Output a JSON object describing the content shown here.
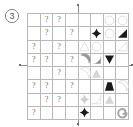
{
  "panel": {
    "label": "3",
    "label_icon": "circled-number-icon"
  },
  "grid": {
    "rows": 8,
    "cols": 8,
    "line_color": "#b9b9b9",
    "unknown_glyph": "?",
    "cells": [
      [
        {
          "type": "empty"
        },
        {
          "type": "unknown",
          "glyph": "?"
        },
        {
          "type": "unknown",
          "glyph": "?"
        },
        {
          "type": "empty"
        },
        {
          "type": "empty"
        },
        {
          "type": "empty"
        },
        {
          "type": "shape",
          "shape": "circle-outline",
          "tone": "faint",
          "color": "#d8d8d8"
        },
        {
          "type": "shape",
          "shape": "circle-outline",
          "tone": "faint",
          "color": "#d8d8d8"
        }
      ],
      [
        {
          "type": "empty"
        },
        {
          "type": "unknown",
          "glyph": "?"
        },
        {
          "type": "empty"
        },
        {
          "type": "unknown",
          "glyph": "?"
        },
        {
          "type": "empty"
        },
        {
          "type": "shape",
          "shape": "four-point-star",
          "tone": "dark",
          "color": "#1b1b1b"
        },
        {
          "type": "shape",
          "shape": "circle-outline",
          "tone": "faint",
          "color": "#d8d8d8"
        },
        {
          "type": "shape",
          "shape": "right-triangle",
          "tone": "dark",
          "color": "#1b1b1b"
        }
      ],
      [
        {
          "type": "unknown",
          "glyph": "?"
        },
        {
          "type": "empty"
        },
        {
          "type": "unknown",
          "glyph": "?"
        },
        {
          "type": "empty"
        },
        {
          "type": "shape",
          "shape": "triangle-outline",
          "tone": "faint",
          "color": "#dcdcdc"
        },
        {
          "type": "shape",
          "shape": "circle-outline",
          "tone": "faint",
          "color": "#dcdcdc"
        },
        {
          "type": "empty"
        },
        {
          "type": "shape",
          "shape": "right-triangle-outline",
          "tone": "faint",
          "color": "#dcdcdc"
        }
      ],
      [
        {
          "type": "unknown",
          "glyph": "?"
        },
        {
          "type": "unknown",
          "glyph": "?"
        },
        {
          "type": "empty"
        },
        {
          "type": "unknown",
          "glyph": "?"
        },
        {
          "type": "shape",
          "shape": "quarter-moon",
          "tone": "mid",
          "color": "#9a9a9a"
        },
        {
          "type": "shape",
          "shape": "quarter-pie",
          "tone": "mid",
          "color": "#8e8e8e"
        },
        {
          "type": "shape",
          "shape": "triangle-down",
          "tone": "dark",
          "color": "#1b1b1b"
        },
        {
          "type": "empty"
        }
      ],
      [
        {
          "type": "empty"
        },
        {
          "type": "empty"
        },
        {
          "type": "unknown",
          "glyph": "?"
        },
        {
          "type": "empty"
        },
        {
          "type": "shape",
          "shape": "quarter-moon-outline",
          "tone": "faint",
          "color": "#e0e0e0"
        },
        {
          "type": "shape",
          "shape": "triangle-up",
          "tone": "faint",
          "color": "#d5d5d5"
        },
        {
          "type": "empty"
        },
        {
          "type": "empty"
        }
      ],
      [
        {
          "type": "unknown",
          "glyph": "?"
        },
        {
          "type": "unknown",
          "glyph": "?"
        },
        {
          "type": "empty"
        },
        {
          "type": "unknown",
          "glyph": "?"
        },
        {
          "type": "empty"
        },
        {
          "type": "empty"
        },
        {
          "type": "shape",
          "shape": "trapezoid",
          "tone": "dark",
          "color": "#1b1b1b"
        },
        {
          "type": "shape",
          "shape": "quarter-moon-outline",
          "tone": "faint",
          "color": "#d8d8d8"
        }
      ],
      [
        {
          "type": "empty"
        },
        {
          "type": "unknown",
          "glyph": "?"
        },
        {
          "type": "unknown",
          "glyph": "?"
        },
        {
          "type": "empty"
        },
        {
          "type": "shape",
          "shape": "four-point-star",
          "tone": "faint",
          "color": "#cfcfcf"
        },
        {
          "type": "shape",
          "shape": "quarter-pie-outline",
          "tone": "faint",
          "color": "#e0e0e0"
        },
        {
          "type": "shape",
          "shape": "triangle-up",
          "tone": "faint",
          "color": "#d5d5d5"
        },
        {
          "type": "empty"
        }
      ],
      [
        {
          "type": "unknown",
          "glyph": "?"
        },
        {
          "type": "empty"
        },
        {
          "type": "empty"
        },
        {
          "type": "empty"
        },
        {
          "type": "shape",
          "shape": "four-point-star",
          "tone": "dark",
          "color": "#1b1b1b"
        },
        {
          "type": "empty"
        },
        {
          "type": "empty"
        },
        {
          "type": "shape",
          "shape": "spiral",
          "tone": "mid",
          "color": "#a6a6a6"
        }
      ]
    ]
  },
  "markers": {
    "top": "alignment-tick",
    "bottom": "alignment-tick",
    "left": "alignment-tick",
    "right": "alignment-tick"
  }
}
